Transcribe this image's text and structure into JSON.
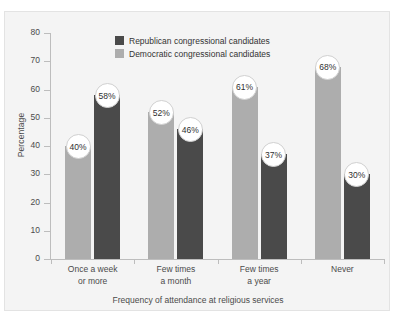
{
  "chart_data": {
    "type": "bar",
    "title": "",
    "xlabel": "Frequency of attendance at religious services",
    "ylabel": "Percentage",
    "ylim": [
      0,
      80
    ],
    "ytick_step": 10,
    "yticks": [
      "0",
      "10",
      "20",
      "30",
      "40",
      "50",
      "60",
      "70",
      "80"
    ],
    "grid": false,
    "legend_position": "top-left-inside",
    "value_suffix": "%",
    "categories": [
      {
        "line1": "Once a week",
        "line2": "or more"
      },
      {
        "line1": "Few times",
        "line2": "a month"
      },
      {
        "line1": "Few times",
        "line2": "a year"
      },
      {
        "line1": "Never",
        "line2": ""
      }
    ],
    "series": [
      {
        "name": "Democratic congressional candidates",
        "key": "dem",
        "color": "#adadad",
        "values": [
          40,
          52,
          61,
          68
        ],
        "labels": [
          "40%",
          "52%",
          "61%",
          "68%"
        ]
      },
      {
        "name": "Republican congressional candidates",
        "key": "rep",
        "color": "#4a4a4a",
        "values": [
          58,
          46,
          37,
          30
        ],
        "labels": [
          "58%",
          "46%",
          "37%",
          "30%"
        ]
      }
    ]
  },
  "legend": {
    "items": [
      {
        "label": "Republican congressional candidates",
        "key": "rep"
      },
      {
        "label": "Democratic congressional candidates",
        "key": "dem"
      }
    ]
  },
  "axes": {
    "y_title": "Percentage",
    "x_title": "Frequency of attendance at religious services"
  }
}
